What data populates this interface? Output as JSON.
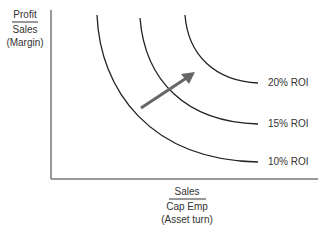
{
  "diagram": {
    "y_axis_label": {
      "numerator": "Profit",
      "denominator": "Sales",
      "note": "(Margin)"
    },
    "x_axis_label": {
      "numerator": "Sales",
      "denominator": "Cap Emp",
      "note": "(Asset turn)"
    },
    "curves": [
      {
        "label": "10% ROI"
      },
      {
        "label": "15% ROI"
      },
      {
        "label": "20% ROI"
      }
    ],
    "arrow": "increasing-roi-direction",
    "colors": {
      "curve": "#222222",
      "axis": "#777777",
      "arrow": "#666666"
    }
  }
}
